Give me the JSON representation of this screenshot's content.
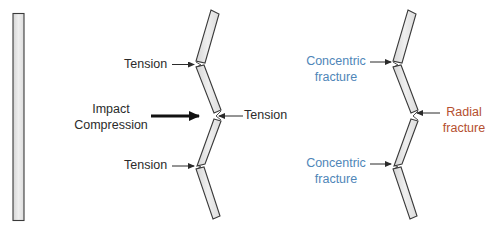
{
  "diagram": {
    "colors": {
      "text": "#2b2b2b",
      "concentric": "#4f86b8",
      "radial": "#b5502f",
      "pane_fill": "#e6e6e6",
      "pane_stroke": "#3a3a3a"
    },
    "panels": [
      {
        "id": "intact",
        "description": "Unbroken glass pane"
      },
      {
        "id": "forces",
        "labels": {
          "tension_top": "Tension",
          "impact_line1": "Impact",
          "impact_line2": "Compression",
          "tension_middle": "Tension",
          "tension_bottom": "Tension"
        }
      },
      {
        "id": "fractures",
        "labels": {
          "concentric_top_line1": "Concentric",
          "concentric_top_line2": "fracture",
          "radial_line1": "Radial",
          "radial_line2": "fracture",
          "concentric_bottom_line1": "Concentric",
          "concentric_bottom_line2": "fracture"
        }
      }
    ]
  }
}
